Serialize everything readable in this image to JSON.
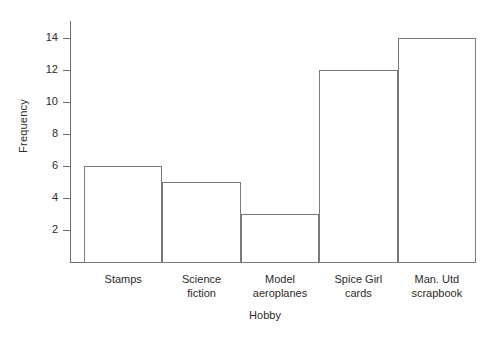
{
  "chart_data": {
    "type": "bar",
    "title": "",
    "xlabel": "Hobby",
    "ylabel": "Frequency",
    "categories": [
      "Stamps",
      "Science fiction",
      "Model aeroplanes",
      "Spice Girl cards",
      "Man. Utd scrapbook"
    ],
    "category_lines": [
      [
        "Stamps"
      ],
      [
        "Science",
        "fiction"
      ],
      [
        "Model",
        "aeroplanes"
      ],
      [
        "Spice Girl",
        "cards"
      ],
      [
        "Man. Utd",
        "scrapbook"
      ]
    ],
    "values": [
      6,
      5,
      3,
      12,
      14
    ],
    "ylim": [
      0,
      15
    ],
    "yticks": [
      2,
      4,
      6,
      8,
      10,
      12,
      14
    ],
    "ytick_labels": [
      "2",
      "4",
      "6",
      "8",
      "10",
      "12",
      "14"
    ],
    "grid": false,
    "legend": false,
    "legend_position": "none",
    "bar_style": {
      "fill": "#ffffff",
      "edge": "#7a7a7a",
      "gap": 0
    },
    "axis_color": "#6e6e6e",
    "text_color": "#2b2b2b",
    "background": "#ffffff"
  }
}
